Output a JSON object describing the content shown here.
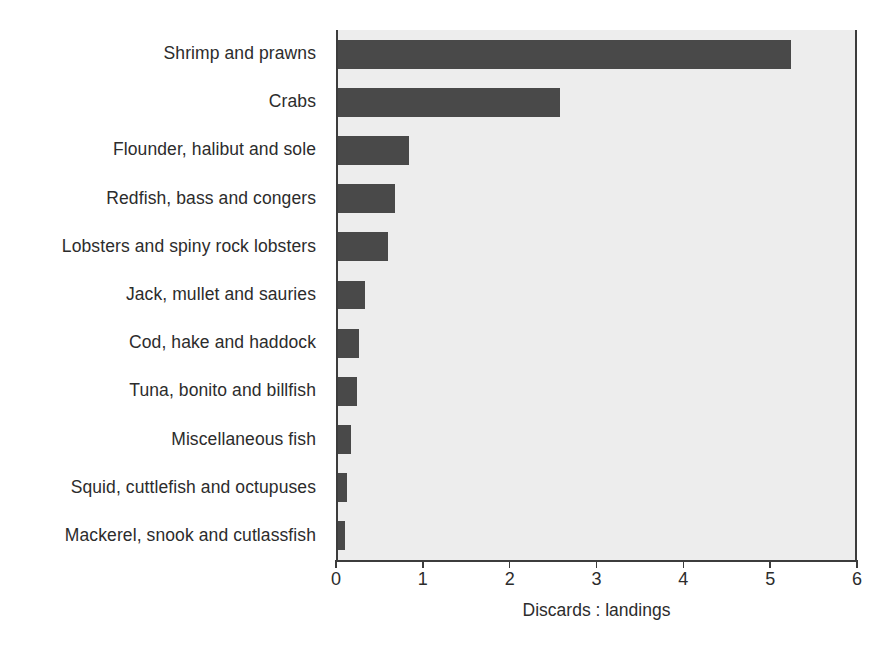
{
  "chart_data": {
    "type": "bar",
    "orientation": "horizontal",
    "title": "",
    "subtitle": "",
    "xlabel": "Discards : landings",
    "ylabel": "",
    "xlim": [
      0,
      6
    ],
    "xticks": [
      0,
      1,
      2,
      3,
      4,
      5,
      6
    ],
    "xtick_labels": [
      "0",
      "1",
      "2",
      "3",
      "4",
      "5",
      "6"
    ],
    "grid": false,
    "legend": null,
    "categories": [
      "Shrimp and prawns",
      "Crabs",
      "Flounder, halibut and sole",
      "Redfish, bass and congers",
      "Lobsters and spiny rock lobsters",
      "Jack, mullet and sauries",
      "Cod, hake and haddock",
      "Tuna, bonito and billfish",
      "Miscellaneous fish",
      "Squid, cuttlefish and octupuses",
      "Mackerel, snook and cutlassfish"
    ],
    "values": [
      5.24,
      2.58,
      0.84,
      0.68,
      0.6,
      0.33,
      0.27,
      0.24,
      0.17,
      0.13,
      0.1
    ],
    "series": [
      {
        "name": "Discards : landings",
        "values": [
          5.24,
          2.58,
          0.84,
          0.68,
          0.6,
          0.33,
          0.27,
          0.24,
          0.17,
          0.13,
          0.1
        ]
      }
    ],
    "colors": {
      "bar": "#494949",
      "plot_background": "#ededed",
      "figure_background": "#ffffff",
      "axis": "#3c3c3c",
      "text": "#2c2c2c"
    }
  }
}
